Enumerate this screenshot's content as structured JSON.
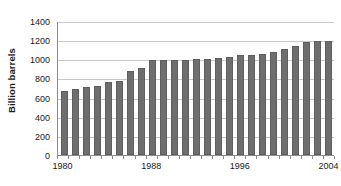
{
  "chart_data": {
    "type": "bar",
    "title": "",
    "xlabel": "",
    "ylabel": "Billion barrels",
    "ylim": [
      0,
      1400
    ],
    "ytick_values": [
      0,
      200,
      400,
      600,
      800,
      1000,
      1200,
      1400
    ],
    "ytick_labels": [
      "0",
      "200",
      "400",
      "600",
      "800",
      "1000",
      "1200",
      "1400"
    ],
    "xtick_labels": [
      "1980",
      "1988",
      "1996",
      "2004"
    ],
    "xtick_categories": [
      "1980",
      "1988",
      "1996",
      "2004"
    ],
    "grid": "horizontal",
    "legend": "none",
    "bar_color": "#6e6e6e",
    "gridline_color": "#c8c8c8",
    "axis_color": "#8c8c8c",
    "categories": [
      "1980",
      "1981",
      "1982",
      "1983",
      "1984",
      "1985",
      "1986",
      "1987",
      "1988",
      "1989",
      "1990",
      "1991",
      "1992",
      "1993",
      "1994",
      "1995",
      "1996",
      "1997",
      "1998",
      "1999",
      "2000",
      "2001",
      "2002",
      "2003",
      "2004"
    ],
    "values": [
      665,
      685,
      710,
      720,
      760,
      770,
      875,
      910,
      990,
      995,
      995,
      995,
      1005,
      1005,
      1010,
      1020,
      1040,
      1050,
      1060,
      1080,
      1105,
      1140,
      1180,
      1190,
      1190
    ]
  }
}
